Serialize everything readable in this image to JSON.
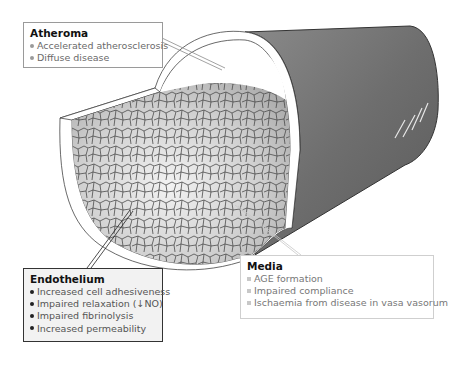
{
  "diagram": {
    "colors": {
      "outer_wall": "#6e6e6e",
      "media_band": "#ffffff",
      "endothelium_cells": "#c9c9c9",
      "cell_outline": "#4a4a4a"
    }
  },
  "callouts": {
    "atheroma": {
      "title": "Atheroma",
      "items": [
        "Accelerated atherosclerosis",
        "Diffuse disease"
      ]
    },
    "endothelium": {
      "title": "Endothelium",
      "items": [
        "Increased cell adhesiveness",
        "Impaired relaxation (↓NO)",
        "Impaired fibrinolysis",
        "Increased permeability"
      ]
    },
    "media": {
      "title": "Media",
      "items": [
        "AGE formation",
        "Impaired compliance",
        "Ischaemia from disease in vasa vasorum"
      ]
    }
  }
}
